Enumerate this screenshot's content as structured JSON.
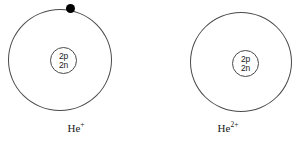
{
  "figure": {
    "background_color": "#ffffff",
    "line_color": "#4a4a4a",
    "electron_color": "#000000",
    "text_color": "#1a1a1a"
  },
  "atoms": [
    {
      "id": "helium-plus",
      "element_symbol": "He",
      "charge_superscript": "+",
      "caption": "He+",
      "nucleus": {
        "protons_label": "2p",
        "neutrons_label": "2n"
      },
      "shell": {
        "electron_count": 1,
        "electrons": [
          {
            "label": "electron",
            "angle_degrees": 90
          }
        ]
      }
    },
    {
      "id": "helium-2-plus",
      "element_symbol": "He",
      "charge_superscript": "2+",
      "caption": "He2+",
      "nucleus": {
        "protons_label": "2p",
        "neutrons_label": "2n"
      },
      "shell": {
        "electron_count": 0,
        "electrons": []
      }
    }
  ]
}
